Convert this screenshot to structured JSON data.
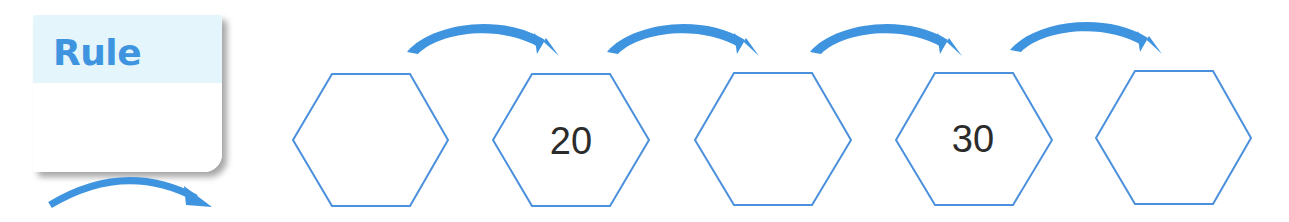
{
  "rule_card": {
    "title": "Rule",
    "value": ""
  },
  "sequence": [
    {
      "index": 1,
      "value": ""
    },
    {
      "index": 2,
      "value": "20"
    },
    {
      "index": 3,
      "value": ""
    },
    {
      "index": 4,
      "value": "30"
    },
    {
      "index": 5,
      "value": ""
    }
  ],
  "colors": {
    "accent_blue": "#3f94e0",
    "hex_stroke": "#4a90dc",
    "header_fill": "#e4f6fc",
    "number_text": "#2b2b2b"
  }
}
